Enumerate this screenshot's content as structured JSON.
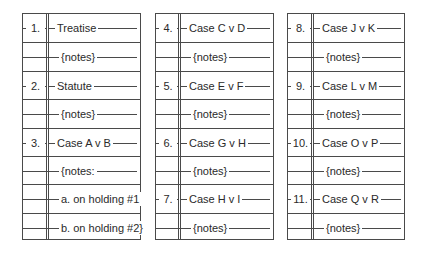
{
  "panels": [
    {
      "rows": [
        {
          "num": "1.",
          "text": "Treatise"
        },
        {
          "num": "",
          "text": "{notes}"
        },
        {
          "num": "2.",
          "text": "Statute"
        },
        {
          "num": "",
          "text": "{notes}"
        },
        {
          "num": "3.",
          "text": "Case A v B"
        },
        {
          "num": "",
          "text": "{notes:"
        },
        {
          "num": "",
          "text": "a. on holding #1"
        },
        {
          "num": "",
          "text": "b. on holding #2}"
        }
      ]
    },
    {
      "rows": [
        {
          "num": "4.",
          "text": "Case C v D"
        },
        {
          "num": "",
          "text": "{notes}"
        },
        {
          "num": "5.",
          "text": "Case E v F"
        },
        {
          "num": "",
          "text": "{notes}"
        },
        {
          "num": "6.",
          "text": "Case G v H"
        },
        {
          "num": "",
          "text": "{notes}"
        },
        {
          "num": "7.",
          "text": "Case H v I"
        },
        {
          "num": "",
          "text": "{notes}"
        }
      ]
    },
    {
      "rows": [
        {
          "num": "8.",
          "text": "Case J v K"
        },
        {
          "num": "",
          "text": "{notes}"
        },
        {
          "num": "9.",
          "text": "Case L v M"
        },
        {
          "num": "",
          "text": "{notes}"
        },
        {
          "num": "10.",
          "text": "Case O v P"
        },
        {
          "num": "",
          "text": "{notes}"
        },
        {
          "num": "11.",
          "text": "Case Q v R"
        },
        {
          "num": "",
          "text": "{notes}"
        }
      ]
    }
  ]
}
